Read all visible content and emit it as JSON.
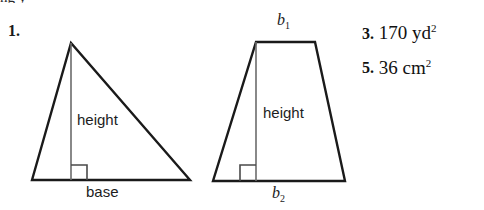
{
  "page": {
    "background_color": "#ffffff",
    "ink_color": "#1a1a1a",
    "top_cut_text": "ng  y"
  },
  "exercise": {
    "number_label": "1."
  },
  "figures": [
    {
      "shape": "triangle",
      "name": "triangle-figure",
      "labels": {
        "height": "height",
        "base": "base"
      },
      "right_angle_marker": true
    },
    {
      "shape": "trapezoid",
      "name": "trapezoid-figure",
      "labels": {
        "top_base": "b",
        "top_base_sub": "1",
        "height": "height",
        "bottom_base": "b",
        "bottom_base_sub": "2"
      },
      "right_angle_marker": true
    }
  ],
  "answers": [
    {
      "number": "3.",
      "value": "170 yd",
      "exponent": "2"
    },
    {
      "number": "5.",
      "value": "36 cm",
      "exponent": "2"
    }
  ]
}
